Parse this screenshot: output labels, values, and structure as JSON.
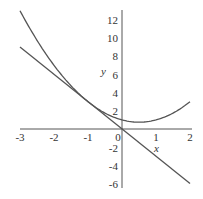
{
  "chart_data": {
    "type": "line",
    "title": "",
    "xlabel": "x",
    "ylabel": "y",
    "xlim": [
      -3,
      2
    ],
    "ylim": [
      -6,
      13
    ],
    "grid": false,
    "legend": null,
    "x_ticks": [
      "-3",
      "-2",
      "-1",
      "0",
      "1",
      "2"
    ],
    "y_ticks": [
      "12",
      "10",
      "8",
      "6",
      "4",
      "2",
      "-2",
      "-4",
      "-6"
    ],
    "series": [
      {
        "name": "curve y = x^2 - x + 1",
        "x": [
          -3,
          -2.5,
          -2,
          -1.5,
          -1,
          -0.5,
          0,
          0.5,
          1,
          1.5,
          2
        ],
        "y": [
          13,
          9.75,
          7,
          4.75,
          3,
          1.75,
          1,
          0.75,
          1,
          1.75,
          3
        ]
      },
      {
        "name": "tangent line y = -3x (at x = -1)",
        "x": [
          -3,
          2
        ],
        "y": [
          9,
          -6
        ]
      }
    ],
    "colors": {
      "curve": "#555555",
      "line": "#555555",
      "axes": "#555555"
    }
  }
}
